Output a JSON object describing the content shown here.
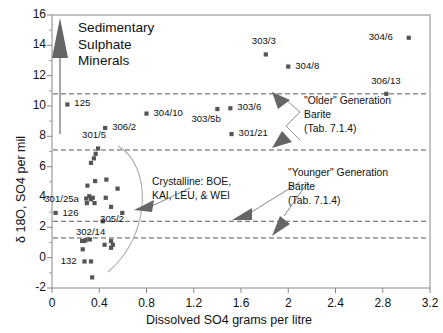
{
  "chart_data": {
    "type": "scatter",
    "title": "",
    "xlabel": "Dissolved SO4  grams per litre",
    "ylabel": "δ 18O, SO4  per mil",
    "xlim": [
      0,
      3.2
    ],
    "ylim": [
      -2,
      16
    ],
    "xticks": [
      0,
      0.4,
      0.8,
      1.2,
      1.6,
      2,
      2.4,
      2.8,
      3.2
    ],
    "xticklabels": [
      "0",
      "0.4",
      "0.8",
      "1.2",
      "1.6",
      "2",
      "2.4",
      "2.8",
      "3.2"
    ],
    "yticks": [
      -2,
      0,
      2,
      4,
      6,
      8,
      10,
      12,
      14,
      16
    ],
    "yticklabels": [
      "-2",
      "0",
      "2",
      "4",
      "6",
      "8",
      "10",
      "12",
      "14",
      "16"
    ],
    "grid": false,
    "marker": "square",
    "marker_color": "#555555",
    "reference_lines": [
      {
        "y": 10.8,
        "style": "dashed"
      },
      {
        "y": 7.1,
        "style": "dashed"
      },
      {
        "y": 2.4,
        "style": "dashed"
      },
      {
        "y": 1.3,
        "style": "dashed"
      }
    ],
    "labeled_points": [
      {
        "label": "125",
        "x": 0.13,
        "y": 10.1,
        "label_pos": "right"
      },
      {
        "label": "304/10",
        "x": 0.8,
        "y": 9.5,
        "label_pos": "right"
      },
      {
        "label": "303/5b",
        "x": 1.4,
        "y": 9.8,
        "label_pos": "below-left"
      },
      {
        "label": "303/6",
        "x": 1.51,
        "y": 9.85,
        "label_pos": "right"
      },
      {
        "label": "301/21",
        "x": 1.52,
        "y": 8.15,
        "label_pos": "right"
      },
      {
        "label": "303/3",
        "x": 1.81,
        "y": 13.4,
        "label_pos": "above"
      },
      {
        "label": "304/8",
        "x": 2.0,
        "y": 12.6,
        "label_pos": "right"
      },
      {
        "label": "306/13",
        "x": 2.83,
        "y": 10.8,
        "label_pos": "above"
      },
      {
        "label": "304/6",
        "x": 3.02,
        "y": 14.5,
        "label_pos": "left"
      },
      {
        "label": "306/2",
        "x": 0.45,
        "y": 8.55,
        "label_pos": "right"
      },
      {
        "label": "301/5",
        "x": 0.39,
        "y": 7.2,
        "label_pos": "above"
      },
      {
        "label": "301/25a",
        "x": 0.29,
        "y": 3.9,
        "label_pos": "left"
      },
      {
        "label": "126",
        "x": 0.03,
        "y": 2.95,
        "label_pos": "right"
      },
      {
        "label": "305/2",
        "x": 0.5,
        "y": 3.35,
        "label_pos": "below"
      },
      {
        "label": "302/14",
        "x": 0.27,
        "y": 1.1,
        "label_pos": "above-left"
      },
      {
        "label": "132",
        "x": 0.26,
        "y": 0.55,
        "label_pos": "left"
      }
    ],
    "unlabeled_points": [
      {
        "x": 0.37,
        "y": 6.85
      },
      {
        "x": 0.355,
        "y": 6.55
      },
      {
        "x": 0.33,
        "y": 6.25
      },
      {
        "x": 0.3,
        "y": 4.75
      },
      {
        "x": 0.365,
        "y": 5.05
      },
      {
        "x": 0.46,
        "y": 5.15
      },
      {
        "x": 0.555,
        "y": 4.55
      },
      {
        "x": 0.315,
        "y": 4.05
      },
      {
        "x": 0.33,
        "y": 3.85
      },
      {
        "x": 0.345,
        "y": 3.95
      },
      {
        "x": 0.36,
        "y": 3.6
      },
      {
        "x": 0.295,
        "y": 3.6
      },
      {
        "x": 0.455,
        "y": 3.95
      },
      {
        "x": 0.595,
        "y": 2.95
      },
      {
        "x": 0.43,
        "y": 2.4
      },
      {
        "x": 0.255,
        "y": 1.1
      },
      {
        "x": 0.285,
        "y": 1.15
      },
      {
        "x": 0.32,
        "y": 1.2
      },
      {
        "x": 0.445,
        "y": 0.85
      },
      {
        "x": 0.5,
        "y": 1.1
      },
      {
        "x": 0.515,
        "y": 0.85
      },
      {
        "x": 0.5,
        "y": 0.65
      },
      {
        "x": 0.275,
        "y": -0.25
      },
      {
        "x": 0.33,
        "y": -0.25
      },
      {
        "x": 0.34,
        "y": -1.3
      }
    ],
    "annotations": [
      {
        "text_lines": [
          "Sedimentary",
          "Sulphate",
          "Minerals"
        ],
        "kind": "arrow-up-label"
      },
      {
        "text_lines": [
          "Crystalline: BOE,",
          "KAI, LEU, & WEI"
        ],
        "kind": "callout"
      },
      {
        "text_lines": [
          "\"Older\" Generation",
          "Barite",
          "(Tab. 7.1.4)"
        ],
        "kind": "callout"
      },
      {
        "text_lines": [
          "\"Younger\" Generation",
          "Barite",
          "(Tab. 7.1.4)"
        ],
        "kind": "callout"
      }
    ]
  },
  "labels": {
    "sedimentary": {
      "l1": "Sedimentary",
      "l2": "Sulphate",
      "l3": "Minerals"
    },
    "crystalline": {
      "l1": "Crystalline: BOE,",
      "l2": "KAI, LEU, & WEI"
    },
    "older": {
      "l1": "\"Older\" Generation",
      "l2": "Barite",
      "l3": "(Tab. 7.1.4)"
    },
    "younger": {
      "l1": "\"Younger\" Generation",
      "l2": "Barite",
      "l3": "(Tab. 7.1.4)"
    }
  },
  "style": {
    "axis_color": "#888888",
    "marker_color": "#555555",
    "text_color": "#111111",
    "dash_color": "#444444",
    "curve_color": "#aaaaaa",
    "arrow_fill": "#666666"
  }
}
